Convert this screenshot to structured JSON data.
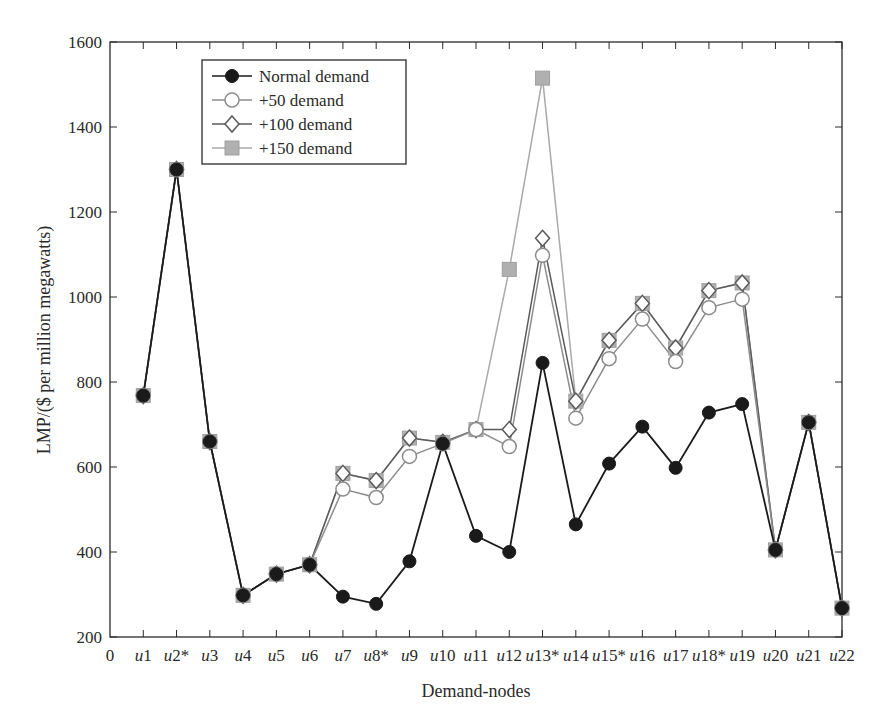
{
  "chart_data": {
    "type": "line",
    "title": "",
    "xlabel": "Demand-nodes",
    "ylabel": "LMP/($ per million megawatts)",
    "ylim": [
      200,
      1600
    ],
    "yticks": [
      200,
      400,
      600,
      800,
      1000,
      1200,
      1400,
      1600
    ],
    "x_origin_label": "0",
    "categories": [
      "u1",
      "u2*",
      "u3",
      "u4",
      "u5",
      "u6",
      "u7",
      "u8*",
      "u9",
      "u10",
      "u11",
      "u12",
      "u13*",
      "u14",
      "u15*",
      "u16",
      "u17",
      "u18*",
      "u19",
      "u20",
      "u21",
      "u22"
    ],
    "grid": false,
    "legend_position": "upper left",
    "series": [
      {
        "name": "Normal demand",
        "marker": "filled-circle",
        "color": "#1a1a1a",
        "values": [
          768,
          1300,
          660,
          298,
          348,
          370,
          295,
          278,
          378,
          655,
          438,
          400,
          845,
          465,
          608,
          695,
          598,
          728,
          748,
          405,
          705,
          268
        ]
      },
      {
        "name": "+50 demand",
        "marker": "open-circle",
        "color": "#8c8c8c",
        "values": [
          768,
          1300,
          660,
          298,
          348,
          370,
          548,
          528,
          625,
          655,
          688,
          648,
          1098,
          715,
          855,
          948,
          848,
          975,
          995,
          405,
          705,
          268
        ]
      },
      {
        "name": "+100 demand",
        "marker": "open-diamond",
        "color": "#5a5a5a",
        "values": [
          768,
          1300,
          660,
          298,
          348,
          370,
          585,
          568,
          668,
          658,
          688,
          688,
          1138,
          755,
          898,
          985,
          880,
          1015,
          1033,
          405,
          705,
          268
        ]
      },
      {
        "name": "+150 demand",
        "marker": "filled-square",
        "color": "#a9a9a9",
        "values": [
          768,
          1300,
          660,
          298,
          348,
          370,
          585,
          568,
          668,
          658,
          688,
          1065,
          1515,
          755,
          898,
          985,
          880,
          1015,
          1033,
          405,
          705,
          268
        ]
      }
    ]
  }
}
